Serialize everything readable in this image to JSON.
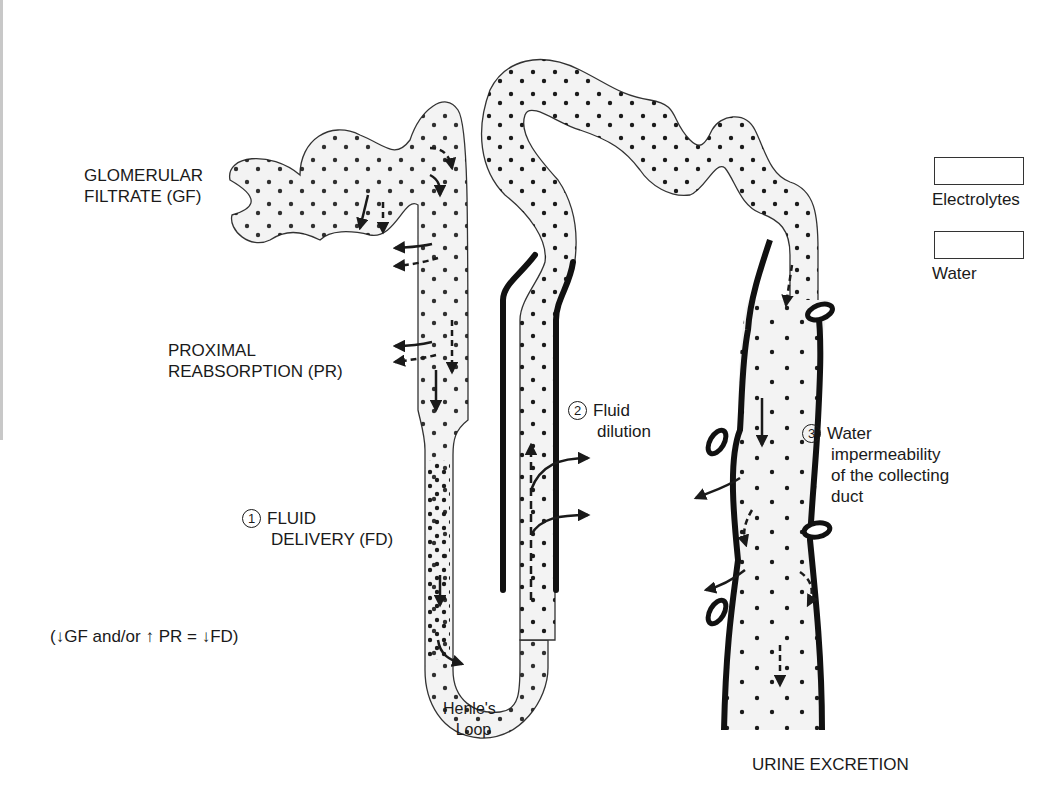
{
  "labels": {
    "glomerular_filtrate": [
      "GLOMERULAR",
      "FILTRATE (GF)"
    ],
    "proximal_reabsorption": [
      "PROXIMAL",
      "REABSORPTION (PR)"
    ],
    "fluid_delivery": {
      "number": "1",
      "lines": [
        "FLUID",
        "DELIVERY (FD)"
      ]
    },
    "equation": "(↓GF and/or ↑ PR = ↓FD)",
    "fluid_dilution": {
      "number": "2",
      "lines": [
        "Fluid",
        "dilution"
      ]
    },
    "water_impermeability": {
      "number": "3",
      "lines": [
        "Water",
        "impermeability",
        "of the collecting",
        "duct"
      ]
    },
    "henles_loop": [
      "Henle's",
      "Loop"
    ],
    "urine_excretion": "URINE EXCRETION"
  },
  "legend": [
    {
      "label": "Electrolytes",
      "arrow": "solid-arrow"
    },
    {
      "label": "Water",
      "arrow": "dashed-arrow"
    }
  ],
  "colors": {
    "ink": "#1a1a1a",
    "tubule_fill": "#f3f3f3",
    "background": "#ffffff"
  }
}
